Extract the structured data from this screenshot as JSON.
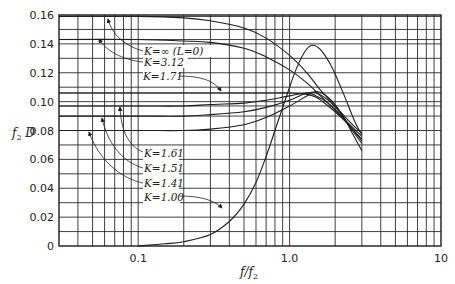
{
  "chart_data": {
    "type": "line",
    "title": "",
    "xlabel": "f/f2",
    "ylabel": "f2 D",
    "xscale": "log",
    "xlim": [
      0.03,
      10
    ],
    "ylim": [
      0,
      0.16
    ],
    "grid": true,
    "legend_position": "inline annotations with leader arrows",
    "x_ticks": [
      {
        "value": 0.1,
        "label": "0.1"
      },
      {
        "value": 1.0,
        "label": "1.0"
      },
      {
        "value": 10,
        "label": "10"
      }
    ],
    "y_ticks": [
      {
        "value": 0,
        "label": "0"
      },
      {
        "value": 0.02,
        "label": "0.02"
      },
      {
        "value": 0.04,
        "label": "0.04"
      },
      {
        "value": 0.06,
        "label": "0.06"
      },
      {
        "value": 0.08,
        "label": "0.08"
      },
      {
        "value": 0.1,
        "label": "0.10"
      },
      {
        "value": 0.12,
        "label": "0.12"
      },
      {
        "value": 0.14,
        "label": "0.14"
      },
      {
        "value": 0.16,
        "label": "0.16"
      }
    ],
    "extra_horizontal_gridlines": [
      0.143,
      0.159,
      0.106,
      0.097
    ],
    "series": [
      {
        "name": "K=∞ (L=0)",
        "x": [
          0.03,
          0.1,
          0.2,
          0.3,
          0.5,
          0.7,
          1.0,
          1.3,
          1.6,
          2.0,
          2.5,
          3.0
        ],
        "y": [
          0.159,
          0.159,
          0.158,
          0.156,
          0.151,
          0.144,
          0.132,
          0.12,
          0.108,
          0.097,
          0.086,
          0.078
        ]
      },
      {
        "name": "K=3.12",
        "x": [
          0.03,
          0.1,
          0.2,
          0.3,
          0.5,
          0.7,
          1.0,
          1.3,
          1.6,
          2.0,
          2.5,
          3.0
        ],
        "y": [
          0.143,
          0.143,
          0.142,
          0.141,
          0.137,
          0.131,
          0.122,
          0.113,
          0.104,
          0.094,
          0.084,
          0.076
        ]
      },
      {
        "name": "K=1.71",
        "x": [
          0.03,
          0.1,
          0.2,
          0.3,
          0.5,
          0.7,
          1.0,
          1.3,
          1.5,
          1.8,
          2.2,
          2.6,
          3.0
        ],
        "y": [
          0.106,
          0.106,
          0.106,
          0.106,
          0.106,
          0.106,
          0.106,
          0.105,
          0.103,
          0.097,
          0.089,
          0.081,
          0.074
        ]
      },
      {
        "name": "K=1.61",
        "x": [
          0.03,
          0.1,
          0.2,
          0.3,
          0.5,
          0.7,
          1.0,
          1.3,
          1.5,
          1.8,
          2.2,
          2.6,
          3.0
        ],
        "y": [
          0.097,
          0.097,
          0.097,
          0.098,
          0.099,
          0.101,
          0.104,
          0.106,
          0.104,
          0.099,
          0.09,
          0.081,
          0.073
        ]
      },
      {
        "name": "K=1.51",
        "x": [
          0.03,
          0.1,
          0.2,
          0.3,
          0.5,
          0.7,
          1.0,
          1.3,
          1.5,
          1.8,
          2.2,
          2.6,
          3.0
        ],
        "y": [
          0.09,
          0.09,
          0.09,
          0.091,
          0.093,
          0.096,
          0.101,
          0.106,
          0.106,
          0.101,
          0.091,
          0.08,
          0.071
        ]
      },
      {
        "name": "K=1.41",
        "x": [
          0.03,
          0.1,
          0.2,
          0.3,
          0.5,
          0.7,
          1.0,
          1.3,
          1.5,
          1.8,
          2.2,
          2.6,
          3.0
        ],
        "y": [
          0.08,
          0.08,
          0.08,
          0.081,
          0.084,
          0.089,
          0.097,
          0.104,
          0.107,
          0.103,
          0.092,
          0.078,
          0.066
        ]
      },
      {
        "name": "K=1.00",
        "x": [
          0.1,
          0.15,
          0.2,
          0.3,
          0.4,
          0.5,
          0.6,
          0.7,
          0.8,
          0.9,
          1.0,
          1.1,
          1.25,
          1.4,
          1.6,
          1.9,
          2.3,
          2.7,
          3.0
        ],
        "y": [
          0.0,
          0.0015,
          0.003,
          0.008,
          0.017,
          0.029,
          0.044,
          0.062,
          0.08,
          0.096,
          0.11,
          0.122,
          0.134,
          0.139,
          0.136,
          0.124,
          0.104,
          0.086,
          0.077
        ]
      }
    ],
    "annotations": [
      {
        "text": "K=∞ (L=0)",
        "series": "K=∞ (L=0)"
      },
      {
        "text": "K=3.12",
        "series": "K=3.12"
      },
      {
        "text": "K=1.71",
        "series": "K=1.71"
      },
      {
        "text": "K=1.61",
        "series": "K=1.61"
      },
      {
        "text": "K=1.51",
        "series": "K=1.51"
      },
      {
        "text": "K=1.41",
        "series": "K=1.41"
      },
      {
        "text": "K=1.00",
        "series": "K=1.00"
      }
    ]
  },
  "labels": {
    "ylabel_main": "f",
    "ylabel_sub": "2",
    "ylabel_tail": " D",
    "xlabel_main": "f/f",
    "xlabel_sub": "2",
    "k_inf": "K=∞ (L=0)",
    "k_312": "K=3.12",
    "k_171": "K=1.71",
    "k_161": "K=1.61",
    "k_151": "K=1.51",
    "k_141": "K=1.41",
    "k_100": "K=1.00"
  }
}
